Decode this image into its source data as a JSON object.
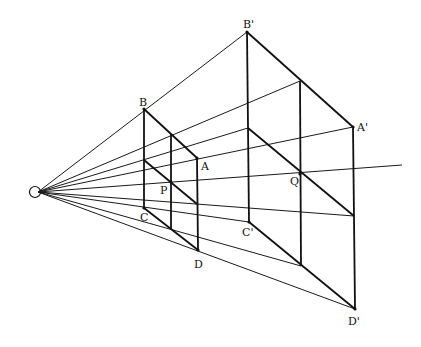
{
  "figure": {
    "eye": {
      "name": "eye-point",
      "symbol": "circle"
    },
    "labels": {
      "B": "B",
      "A": "A",
      "P": "P",
      "C": "C",
      "D": "D",
      "B_prime": "B'",
      "A_prime": "A'",
      "Q": "Q",
      "C_prime": "C'",
      "D_prime": "D'"
    },
    "colors": {
      "line": "#111111",
      "background": "#ffffff"
    }
  }
}
